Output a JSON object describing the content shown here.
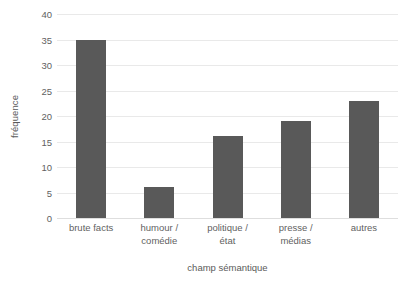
{
  "chart_data": {
    "type": "bar",
    "title": "",
    "categories": [
      "brute facts",
      "humour /\ncomédie",
      "politique /\nétat",
      "presse /\nmédias",
      "autres"
    ],
    "values": [
      35,
      6,
      16,
      19,
      23
    ],
    "xlabel": "champ sémantique",
    "ylabel": "fréquence",
    "ylim": [
      0,
      40
    ],
    "ytick_step": 5,
    "yticks": [
      0,
      5,
      10,
      15,
      20,
      25,
      30,
      35,
      40
    ],
    "ytick_labels": [
      "0",
      "5",
      "10",
      "15",
      "20",
      "25",
      "30",
      "35",
      "40"
    ],
    "grid": true,
    "grid_axis": "y",
    "legend": false,
    "legend_position": "none",
    "colors": {
      "bar": "#595959",
      "gridline": "#e9e9e9",
      "baseline": "#dedede",
      "text": "#5f5f5f",
      "background": "#ffffff"
    }
  }
}
